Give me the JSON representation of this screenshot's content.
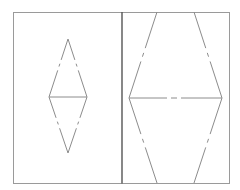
{
  "diagram": {
    "background": "#ffffff",
    "frame": {
      "x": 13,
      "y": 12,
      "width": 216,
      "height": 171,
      "color": "#9a9a9a"
    },
    "divider": {
      "x": 122,
      "y1": 12,
      "y2": 183,
      "color": "#555555"
    },
    "left_panel": {
      "shape": "diamond",
      "vertices": {
        "top": [
          68,
          39
        ],
        "left": [
          49,
          97
        ],
        "right": [
          87,
          97
        ],
        "bottom": [
          68,
          153
        ]
      },
      "horizontal_axis": {
        "from": [
          49,
          97
        ],
        "to": [
          87,
          97
        ],
        "style": "solid"
      },
      "edges_style": "dash-dot"
    },
    "right_panel": {
      "shape": "hexagon",
      "vertices": {
        "top_left": [
          157,
          12
        ],
        "top_right": [
          194,
          12
        ],
        "left": [
          129,
          98
        ],
        "right": [
          222,
          98
        ],
        "bottom_left": [
          157,
          183
        ],
        "bottom_right": [
          194,
          183
        ]
      },
      "horizontal_axis": {
        "from": [
          129,
          98
        ],
        "to": [
          222,
          98
        ],
        "style": "dash-dot"
      },
      "edges_style": "dash-dot"
    }
  }
}
